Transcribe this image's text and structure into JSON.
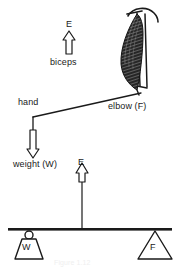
{
  "figure": {
    "background_color": "#ffffff",
    "ink_color": "#1a1a1a",
    "caption": "Figure 1.12"
  },
  "anatomy_panel": {
    "effort_label": "E",
    "muscle_label": "biceps",
    "hand_label": "hand",
    "fulcrum_label": "elbow (F)",
    "load_label": "weight (W)",
    "muscle_shape": "biceps-muscle-striated",
    "humerus_shape": "upper-arm-bone",
    "shoulder_arc_shape": "shoulder-arc",
    "forearm_shape": "forearm-line",
    "effort_arrow_direction": "up",
    "load_arrow_direction": "down"
  },
  "lever_panel": {
    "effort_label": "E",
    "effort_arrow_direction": "up",
    "weight_block_label": "W",
    "fulcrum_triangle_label": "F",
    "beam_shape": "lever-beam",
    "weight_shape": "hanging-weight-block",
    "fulcrum_shape": "fulcrum-triangle"
  }
}
